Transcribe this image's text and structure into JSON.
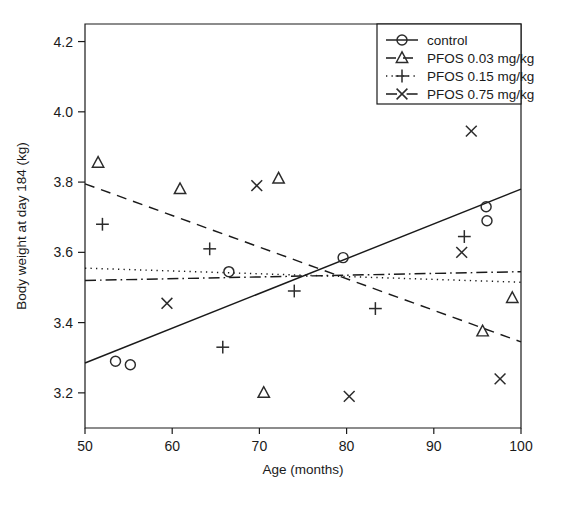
{
  "chart_data": {
    "type": "scatter",
    "title": "",
    "xlabel": "Age (months)",
    "ylabel": "Body weight at day 184 (kg)",
    "xlim": [
      50,
      100
    ],
    "ylim": [
      3.1,
      4.25
    ],
    "xticks": [
      50,
      60,
      70,
      80,
      90,
      100
    ],
    "xticklabels": [
      "50",
      "60",
      "70",
      "80",
      "90",
      "100"
    ],
    "yticks": [
      3.2,
      3.4,
      3.6,
      3.8,
      4.0,
      4.2
    ],
    "yticklabels": [
      "3.2",
      "3.4",
      "3.6",
      "3.8",
      "4.0",
      "4.2"
    ],
    "grid": false,
    "legend_position": "top-right",
    "series": [
      {
        "name": "control",
        "marker": "circle",
        "linestyle": "solid",
        "points": [
          {
            "x": 53.5,
            "y": 3.29
          },
          {
            "x": 55.2,
            "y": 3.28
          },
          {
            "x": 66.5,
            "y": 3.545
          },
          {
            "x": 79.6,
            "y": 3.585
          },
          {
            "x": 96.0,
            "y": 3.73
          },
          {
            "x": 96.1,
            "y": 3.69
          }
        ],
        "fit_line": {
          "x0": 50,
          "y0": 3.285,
          "x1": 100,
          "y1": 3.78
        }
      },
      {
        "name": "PFOS 0.03 mg/kg",
        "marker": "triangle",
        "linestyle": "dashed",
        "points": [
          {
            "x": 51.5,
            "y": 3.855
          },
          {
            "x": 60.9,
            "y": 3.78
          },
          {
            "x": 70.5,
            "y": 3.2
          },
          {
            "x": 72.2,
            "y": 3.81
          },
          {
            "x": 95.6,
            "y": 3.375
          },
          {
            "x": 99.0,
            "y": 3.47
          }
        ],
        "fit_line": {
          "x0": 50,
          "y0": 3.795,
          "x1": 100,
          "y1": 3.345
        }
      },
      {
        "name": "PFOS 0.15 mg/kg",
        "marker": "plus",
        "linestyle": "dotted",
        "points": [
          {
            "x": 52.0,
            "y": 3.68
          },
          {
            "x": 64.3,
            "y": 3.61
          },
          {
            "x": 65.8,
            "y": 3.33
          },
          {
            "x": 74.0,
            "y": 3.49
          },
          {
            "x": 83.3,
            "y": 3.44
          },
          {
            "x": 93.5,
            "y": 3.645
          }
        ],
        "fit_line": {
          "x0": 50,
          "y0": 3.555,
          "x1": 100,
          "y1": 3.515
        }
      },
      {
        "name": "PFOS 0.75 mg/kg",
        "marker": "cross",
        "linestyle": "dashdot",
        "points": [
          {
            "x": 59.4,
            "y": 3.455
          },
          {
            "x": 69.7,
            "y": 3.79
          },
          {
            "x": 80.3,
            "y": 3.19
          },
          {
            "x": 93.2,
            "y": 3.6
          },
          {
            "x": 94.3,
            "y": 3.945
          },
          {
            "x": 97.6,
            "y": 3.24
          }
        ],
        "fit_line": {
          "x0": 50,
          "y0": 3.52,
          "x1": 100,
          "y1": 3.545
        }
      }
    ]
  },
  "legend": {
    "entries": [
      {
        "label": "control"
      },
      {
        "label": "PFOS 0.03 mg/kg"
      },
      {
        "label": "PFOS 0.15 mg/kg"
      },
      {
        "label": "PFOS 0.75 mg/kg"
      }
    ]
  },
  "colors": {
    "ink": "#1a1a1a",
    "marker": "#2b2b2b",
    "background": "#ffffff"
  }
}
